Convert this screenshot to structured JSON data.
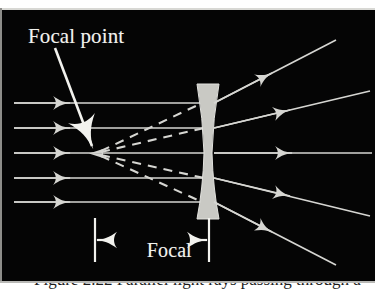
{
  "figure": {
    "kind": "optics-ray-diagram",
    "panel_background": "#050505",
    "ray_color": "#d6d6d2",
    "lens_color": "#c9c9c4",
    "label_color": "#f2f2ee",
    "page_background": "#ffffff"
  },
  "labels": {
    "focal_point": "Focal point",
    "focal_length_line1": "Focal",
    "focal_length_line2": "length"
  },
  "caption": {
    "text": "Figure 2.22  Parallel light rays passing through a"
  },
  "diagram": {
    "lens": {
      "type": "biconcave",
      "center_x": 208,
      "top_y": 84,
      "bottom_y": 219,
      "outer_half_width": 11,
      "waist_half_width": 4
    },
    "focal_point": {
      "x": 96,
      "y": 153
    },
    "optical_axis_y": 153,
    "incoming_rays": [
      {
        "id": "ray-1",
        "y": 103,
        "x_start": 14,
        "x_end": 203,
        "arrow_x": 68
      },
      {
        "id": "ray-2",
        "y": 128,
        "x_start": 14,
        "x_end": 205,
        "arrow_x": 68
      },
      {
        "id": "ray-3",
        "y": 153,
        "x_start": 14,
        "x_end": 208,
        "arrow_x": 68
      },
      {
        "id": "ray-4",
        "y": 178,
        "x_start": 14,
        "x_end": 205,
        "arrow_x": 68
      },
      {
        "id": "ray-5",
        "y": 202,
        "x_start": 14,
        "x_end": 203,
        "arrow_x": 68
      }
    ],
    "outgoing_rays": [
      {
        "id": "out-1",
        "x1": 212,
        "y1": 103,
        "x2": 336,
        "y2": 40,
        "arrow_t": 0.45
      },
      {
        "id": "out-2",
        "x1": 212,
        "y1": 128,
        "x2": 368,
        "y2": 91,
        "arrow_t": 0.45
      },
      {
        "id": "out-3",
        "x1": 214,
        "y1": 153,
        "x2": 372,
        "y2": 153,
        "arrow_t": 0.45
      },
      {
        "id": "out-4",
        "x1": 212,
        "y1": 178,
        "x2": 368,
        "y2": 216,
        "arrow_t": 0.45
      },
      {
        "id": "out-5",
        "x1": 212,
        "y1": 202,
        "x2": 336,
        "y2": 265,
        "arrow_t": 0.45
      }
    ],
    "virtual_dashed_rays": [
      {
        "id": "dash-1",
        "x1": 99,
        "y1": 151,
        "x2": 203,
        "y2": 103
      },
      {
        "id": "dash-2",
        "x1": 99,
        "y1": 152,
        "x2": 205,
        "y2": 128
      },
      {
        "id": "dash-3",
        "x1": 99,
        "y1": 155,
        "x2": 205,
        "y2": 178
      },
      {
        "id": "dash-4",
        "x1": 99,
        "y1": 156,
        "x2": 203,
        "y2": 202
      }
    ],
    "pointer_arrow": {
      "x1": 54,
      "y1": 47,
      "x2": 93,
      "y2": 149
    },
    "focal_length_measure": {
      "left_tick_x": 95,
      "right_tick_x": 208,
      "tick_top_y": 218,
      "tick_bottom_y": 262,
      "arrow_y": 240,
      "left_arrow_from_x": 104,
      "left_arrow_to_x": 96,
      "right_arrow_from_x": 199,
      "right_arrow_to_x": 207
    }
  }
}
